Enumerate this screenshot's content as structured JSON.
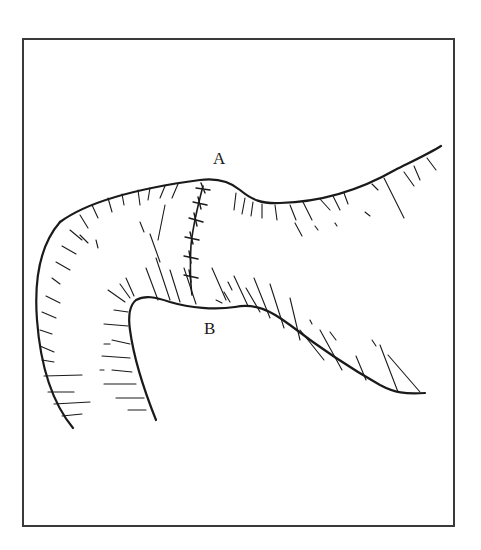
{
  "figure": {
    "labels": {
      "a": "A",
      "b": "B"
    },
    "caption": "",
    "colors": {
      "ink": "#1a1a1a",
      "frame": "#3a3a3a",
      "background": "#ffffff"
    }
  }
}
